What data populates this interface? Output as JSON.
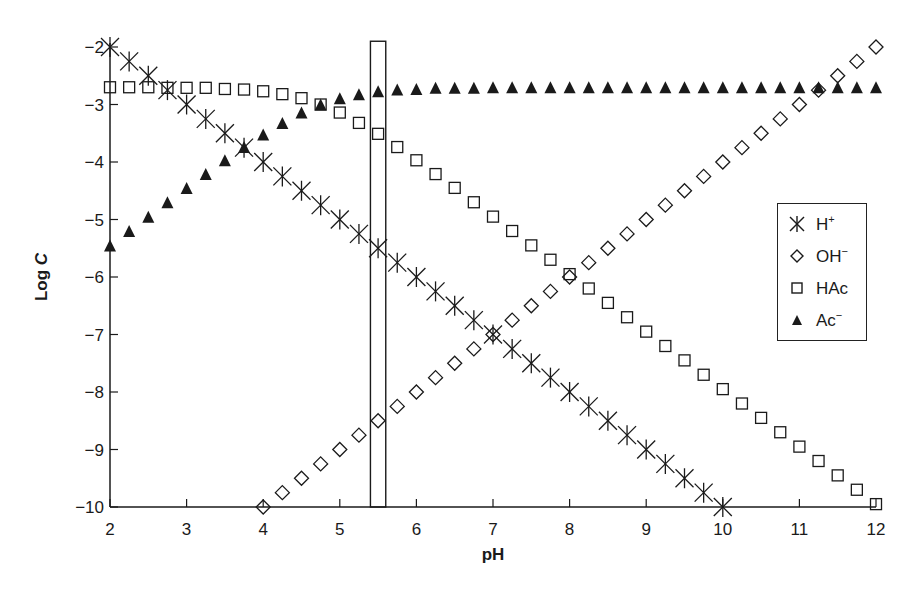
{
  "chart_data": {
    "type": "scatter",
    "title": "",
    "xlabel": "pH",
    "ylabel": "Log C",
    "xlim": [
      2,
      12
    ],
    "ylim": [
      -10,
      -2
    ],
    "xticks": [
      2,
      3,
      4,
      5,
      6,
      7,
      8,
      9,
      10,
      11,
      12
    ],
    "yticks": [
      -2,
      -3,
      -4,
      -5,
      -6,
      -7,
      -8,
      -9,
      -10
    ],
    "grid": false,
    "legend_position": "right-center",
    "annotations": [
      {
        "type": "rectangle",
        "x_range": [
          5.4,
          5.6
        ],
        "y_range": [
          -10,
          -1.9
        ]
      }
    ],
    "series": [
      {
        "name": "H+",
        "label_base": "H",
        "label_sup": "+",
        "marker": "asterisk",
        "x": [
          2,
          2.25,
          2.5,
          2.75,
          3,
          3.25,
          3.5,
          3.75,
          4,
          4.25,
          4.5,
          4.75,
          5,
          5.25,
          5.5,
          5.75,
          6,
          6.25,
          6.5,
          6.75,
          7,
          7.25,
          7.5,
          7.75,
          8,
          8.25,
          8.5,
          8.75,
          9,
          9.25,
          9.5,
          9.75,
          10
        ],
        "y": [
          -2,
          -2.25,
          -2.5,
          -2.75,
          -3,
          -3.25,
          -3.5,
          -3.75,
          -4,
          -4.25,
          -4.5,
          -4.75,
          -5,
          -5.25,
          -5.5,
          -5.75,
          -6,
          -6.25,
          -6.5,
          -6.75,
          -7,
          -7.25,
          -7.5,
          -7.75,
          -8,
          -8.25,
          -8.5,
          -8.75,
          -9,
          -9.25,
          -9.5,
          -9.75,
          -10
        ]
      },
      {
        "name": "OH-",
        "label_base": "OH",
        "label_sup": "−",
        "marker": "diamond",
        "x": [
          4,
          4.25,
          4.5,
          4.75,
          5,
          5.25,
          5.5,
          5.75,
          6,
          6.25,
          6.5,
          6.75,
          7,
          7.25,
          7.5,
          7.75,
          8,
          8.25,
          8.5,
          8.75,
          9,
          9.25,
          9.5,
          9.75,
          10,
          10.25,
          10.5,
          10.75,
          11,
          11.25,
          11.5,
          11.75,
          12
        ],
        "y": [
          -10,
          -9.75,
          -9.5,
          -9.25,
          -9,
          -8.75,
          -8.5,
          -8.25,
          -8,
          -7.75,
          -7.5,
          -7.25,
          -7,
          -6.75,
          -6.5,
          -6.25,
          -6,
          -5.75,
          -5.5,
          -5.25,
          -5,
          -4.75,
          -4.5,
          -4.25,
          -4,
          -3.75,
          -3.5,
          -3.25,
          -3,
          -2.75,
          -2.5,
          -2.25,
          -2
        ]
      },
      {
        "name": "HAc",
        "label_base": "HAc",
        "label_sup": "",
        "marker": "square",
        "x": [
          2,
          2.25,
          2.5,
          2.75,
          3,
          3.25,
          3.5,
          3.75,
          4,
          4.25,
          4.5,
          4.75,
          5,
          5.25,
          5.5,
          5.75,
          6,
          6.25,
          6.5,
          6.75,
          7,
          7.25,
          7.5,
          7.75,
          8,
          8.25,
          8.5,
          8.75,
          9,
          9.25,
          9.5,
          9.75,
          10,
          10.25,
          10.5,
          10.75,
          11,
          11.25,
          11.5,
          11.75,
          12
        ],
        "y": [
          -2.7,
          -2.7,
          -2.7,
          -2.71,
          -2.71,
          -2.71,
          -2.73,
          -2.74,
          -2.77,
          -2.82,
          -2.89,
          -3.0,
          -3.14,
          -3.32,
          -3.51,
          -3.74,
          -3.97,
          -4.21,
          -4.45,
          -4.7,
          -4.95,
          -5.2,
          -5.45,
          -5.7,
          -5.95,
          -6.2,
          -6.45,
          -6.7,
          -6.95,
          -7.2,
          -7.45,
          -7.7,
          -7.95,
          -8.2,
          -8.45,
          -8.7,
          -8.95,
          -9.2,
          -9.45,
          -9.7,
          -9.95
        ]
      },
      {
        "name": "Ac-",
        "label_base": "Ac",
        "label_sup": "−",
        "marker": "triangle",
        "x": [
          2,
          2.25,
          2.5,
          2.75,
          3,
          3.25,
          3.5,
          3.75,
          4,
          4.25,
          4.5,
          4.75,
          5,
          5.25,
          5.5,
          5.75,
          6,
          6.25,
          6.5,
          6.75,
          7,
          7.25,
          7.5,
          7.75,
          8,
          8.25,
          8.5,
          8.75,
          9,
          9.25,
          9.5,
          9.75,
          10,
          10.25,
          10.5,
          10.75,
          11,
          11.25,
          11.5,
          11.75,
          12
        ],
        "y": [
          -5.45,
          -5.2,
          -4.95,
          -4.7,
          -4.45,
          -4.21,
          -3.97,
          -3.74,
          -3.52,
          -3.32,
          -3.14,
          -3.0,
          -2.89,
          -2.82,
          -2.77,
          -2.74,
          -2.73,
          -2.71,
          -2.71,
          -2.71,
          -2.7,
          -2.7,
          -2.7,
          -2.7,
          -2.7,
          -2.7,
          -2.7,
          -2.7,
          -2.7,
          -2.7,
          -2.7,
          -2.7,
          -2.7,
          -2.7,
          -2.7,
          -2.7,
          -2.7,
          -2.7,
          -2.7,
          -2.7,
          -2.7
        ]
      }
    ]
  },
  "axes": {
    "xlabel": "pH",
    "ylabel_base": "Log ",
    "ylabel_italic": "C"
  },
  "legend": {
    "items": [
      {
        "base": "H",
        "sup": "+"
      },
      {
        "base": "OH",
        "sup": "−"
      },
      {
        "base": "HAc",
        "sup": ""
      },
      {
        "base": "Ac",
        "sup": "−"
      }
    ]
  },
  "colors": {
    "ink": "#1a1a1a",
    "background": "#ffffff"
  }
}
